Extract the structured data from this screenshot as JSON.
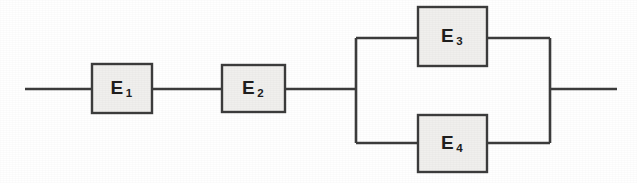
{
  "diagram": {
    "type": "reliability-block-diagram",
    "title": "",
    "background_color": "#ffffff",
    "line_color": "#3c3c3c",
    "block_fill_color": "#f0efed",
    "blocks": [
      {
        "id": "E1",
        "label": "E",
        "subscript": "1",
        "x": 92,
        "y": 64,
        "width": 60,
        "height": 49,
        "branch": "series"
      },
      {
        "id": "E2",
        "label": "E",
        "subscript": "2",
        "x": 222,
        "y": 65,
        "width": 63,
        "height": 47,
        "branch": "series"
      },
      {
        "id": "E3",
        "label": "E",
        "subscript": "3",
        "x": 418,
        "y": 7,
        "width": 69,
        "height": 59,
        "branch": "parallel-upper"
      },
      {
        "id": "E4",
        "label": "E",
        "subscript": "4",
        "x": 418,
        "y": 115,
        "width": 69,
        "height": 57,
        "branch": "parallel-lower"
      }
    ],
    "connections": {
      "input_wire": {
        "x1": 25,
        "y1": 89,
        "x2": 92,
        "y2": 89
      },
      "e1_to_e2": {
        "x1": 152,
        "y1": 89,
        "x2": 222,
        "y2": 89
      },
      "e2_to_split": {
        "x1": 285,
        "y1": 89,
        "x2": 356,
        "y2": 89
      },
      "left_bus": {
        "x": 356,
        "y1": 38,
        "y2": 143
      },
      "right_bus": {
        "x": 550,
        "y1": 38,
        "y2": 143
      },
      "upper_rail_left": {
        "x1": 356,
        "y1": 38,
        "x2": 418,
        "y2": 38
      },
      "upper_rail_right": {
        "x1": 487,
        "y1": 38,
        "x2": 550,
        "y2": 38
      },
      "lower_rail_left": {
        "x1": 356,
        "y1": 143,
        "x2": 418,
        "y2": 143
      },
      "lower_rail_right": {
        "x1": 487,
        "y1": 143,
        "x2": 550,
        "y2": 143
      },
      "output_wire": {
        "x1": 550,
        "y1": 89,
        "x2": 617,
        "y2": 89
      }
    },
    "topology_description": "E1 and E2 in series, followed by E3 and E4 in parallel"
  }
}
